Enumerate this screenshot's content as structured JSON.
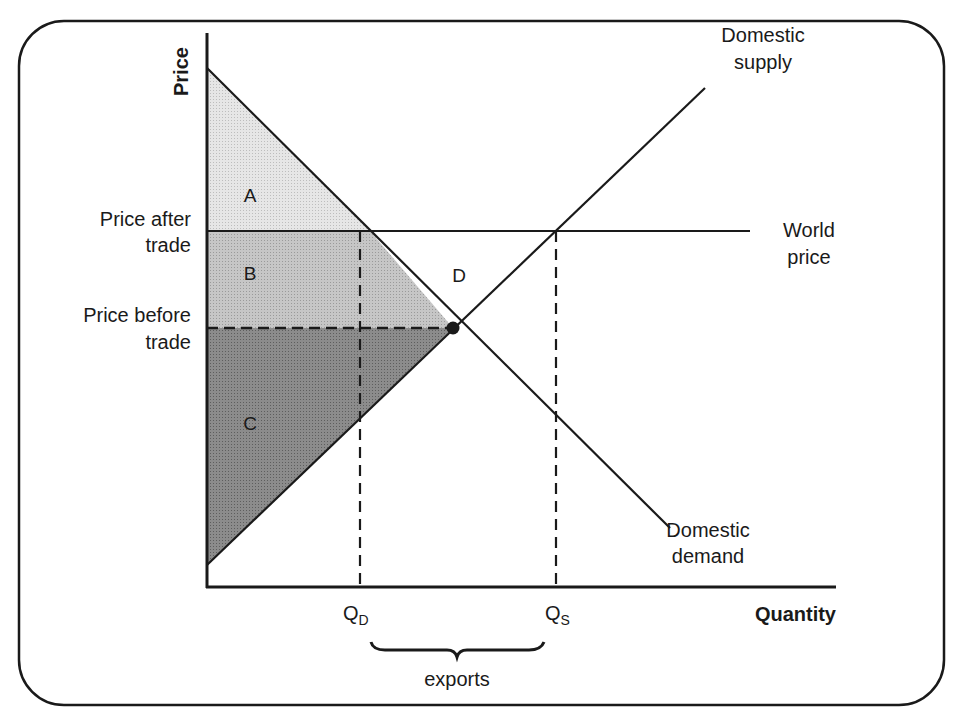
{
  "diagram": {
    "type": "supply-demand-trade",
    "title_cutoff": "",
    "axes": {
      "y_label": "Price",
      "x_label": "Quantity"
    },
    "curves": {
      "supply_label_line1": "Domestic",
      "supply_label_line2": "supply",
      "demand_label_line1": "Domestic",
      "demand_label_line2": "demand",
      "world_price_line1": "World",
      "world_price_line2": "price"
    },
    "price_levels": {
      "after_line1": "Price after",
      "after_line2": "trade",
      "before_line1": "Price before",
      "before_line2": "trade"
    },
    "quantities": {
      "qd_main": "Q",
      "qd_sub": "D",
      "qs_main": "Q",
      "qs_sub": "S",
      "exports_label": "exports"
    },
    "regions": {
      "a": "A",
      "b": "B",
      "c": "C",
      "d": "D"
    },
    "colors": {
      "line": "#1a1a1a",
      "region_a": "#e4e4e4",
      "region_b": "#c2c2c2",
      "region_c": "#8a8a8a",
      "region_d": "#ffffff",
      "background": "#ffffff"
    }
  }
}
